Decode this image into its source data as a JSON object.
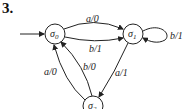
{
  "problem_number": "3.",
  "diagram": {
    "type": "finite-state machine",
    "start_state": "s0",
    "states": [
      {
        "id": "s0",
        "label": "σ",
        "sub": "0"
      },
      {
        "id": "s1",
        "label": "σ",
        "sub": "1"
      },
      {
        "id": "s2",
        "label": "σ",
        "sub": "2"
      }
    ],
    "transitions": [
      {
        "from": "s0",
        "to": "s1",
        "label": "a/0"
      },
      {
        "from": "s0",
        "to": "s1",
        "label": "b/1"
      },
      {
        "from": "s1",
        "to": "s1",
        "label": "b/1"
      },
      {
        "from": "s1",
        "to": "s2",
        "label": "a/1"
      },
      {
        "from": "s2",
        "to": "s0",
        "label": "a/0"
      },
      {
        "from": "s2",
        "to": "s0",
        "label": "b/0"
      }
    ]
  }
}
